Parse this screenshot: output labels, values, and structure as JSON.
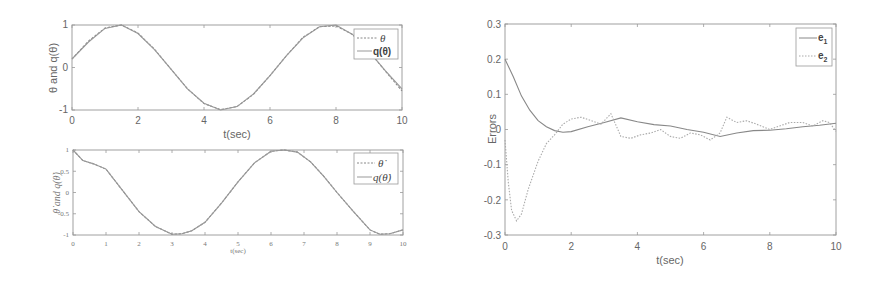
{
  "chart_data": [
    {
      "id": "top-left",
      "type": "line",
      "title": "",
      "xlabel": "t(sec)",
      "ylabel": "θ and q(θ)",
      "xlim": [
        0,
        10
      ],
      "ylim": [
        -1,
        1
      ],
      "xticks": [
        0,
        2,
        4,
        6,
        8,
        10
      ],
      "xtick_labels": [
        "0",
        "2",
        "4",
        "6",
        "8",
        "10"
      ],
      "yticks": [
        1,
        0,
        -1
      ],
      "ytick_labels": [
        "1",
        "0",
        "-1"
      ],
      "grid": false,
      "legend_position": "upper right",
      "series": [
        {
          "name": "θ",
          "style": "dashed",
          "color": "#888888",
          "x": [
            0,
            0.5,
            1,
            1.5,
            2,
            2.5,
            3,
            3.5,
            4,
            4.5,
            5,
            5.5,
            6,
            6.5,
            7,
            7.5,
            8,
            8.5,
            9,
            9.5,
            10
          ],
          "values": [
            0.2,
            0.62,
            0.93,
            1.0,
            0.81,
            0.43,
            -0.04,
            -0.5,
            -0.85,
            -0.99,
            -0.92,
            -0.63,
            -0.19,
            0.28,
            0.71,
            0.96,
            0.98,
            0.78,
            0.38,
            -0.09,
            -0.55
          ]
        },
        {
          "name": "q(θ)",
          "style": "solid",
          "color": "#999999",
          "x": [
            0,
            0.5,
            1,
            1.5,
            2,
            2.5,
            3,
            3.5,
            4,
            4.5,
            5,
            5.5,
            6,
            6.5,
            7,
            7.5,
            8,
            8.5,
            9,
            9.5,
            10
          ],
          "values": [
            0.2,
            0.6,
            0.92,
            1.0,
            0.8,
            0.42,
            -0.04,
            -0.5,
            -0.84,
            -1.0,
            -0.92,
            -0.62,
            -0.19,
            0.28,
            0.7,
            0.96,
            1.0,
            0.78,
            0.38,
            -0.08,
            -0.5
          ]
        }
      ]
    },
    {
      "id": "bottom-left",
      "type": "line",
      "title": "",
      "xlabel": "t(sec)",
      "ylabel": "θ̇ and q(θ̇)",
      "xlim": [
        0,
        10
      ],
      "ylim": [
        -1,
        1
      ],
      "xticks": [
        0,
        1,
        2,
        3,
        4,
        5,
        6,
        7,
        8,
        9,
        10
      ],
      "xtick_labels": [
        "0",
        "1",
        "2",
        "3",
        "4",
        "5",
        "6",
        "7",
        "8",
        "9",
        "10"
      ],
      "yticks": [
        1,
        0.5,
        0,
        -0.5,
        -1
      ],
      "ytick_labels": [
        "1",
        "0.5",
        "0",
        "-0.5",
        "-1"
      ],
      "grid": false,
      "legend_position": "upper right",
      "series": [
        {
          "name": "θ̇",
          "style": "dashed",
          "color": "#888888",
          "x": [
            0,
            0.3,
            0.6,
            1,
            1.5,
            2,
            2.5,
            3,
            3.3,
            3.6,
            4,
            4.5,
            5,
            5.5,
            6,
            6.4,
            6.8,
            7.2,
            7.6,
            8,
            8.5,
            9,
            9.3,
            9.6,
            10
          ],
          "values": [
            1.0,
            0.75,
            0.68,
            0.55,
            0.05,
            -0.45,
            -0.8,
            -0.98,
            -0.97,
            -0.9,
            -0.7,
            -0.25,
            0.25,
            0.7,
            0.97,
            1.0,
            0.95,
            0.72,
            0.38,
            0.0,
            -0.45,
            -0.88,
            -0.98,
            -0.97,
            -0.88
          ]
        },
        {
          "name": "q(θ̇)",
          "style": "solid",
          "color": "#999999",
          "x": [
            0,
            0.3,
            0.6,
            1,
            1.5,
            2,
            2.5,
            3,
            3.3,
            3.6,
            4,
            4.5,
            5,
            5.5,
            6,
            6.4,
            6.8,
            7.2,
            7.6,
            8,
            8.5,
            9,
            9.3,
            9.6,
            10
          ],
          "values": [
            1.0,
            0.75,
            0.68,
            0.55,
            0.05,
            -0.45,
            -0.8,
            -0.98,
            -0.97,
            -0.9,
            -0.7,
            -0.25,
            0.25,
            0.7,
            0.97,
            1.0,
            0.95,
            0.72,
            0.38,
            0.0,
            -0.45,
            -0.88,
            -0.98,
            -0.97,
            -0.88
          ]
        }
      ]
    },
    {
      "id": "right",
      "type": "line",
      "title": "",
      "xlabel": "t(sec)",
      "ylabel": "Errors",
      "xlim": [
        0,
        10
      ],
      "ylim": [
        -0.3,
        0.3
      ],
      "xticks": [
        0,
        2,
        4,
        6,
        8,
        10
      ],
      "xtick_labels": [
        "0",
        "2",
        "4",
        "6",
        "8",
        "10"
      ],
      "yticks": [
        0.3,
        0.2,
        0.1,
        0,
        -0.1,
        -0.2,
        -0.3
      ],
      "ytick_labels": [
        "0.3",
        "0.2",
        "0.1",
        "0",
        "-0.1",
        "-0.2",
        "-0.3"
      ],
      "grid": false,
      "legend_position": "upper right",
      "series": [
        {
          "name": "e1",
          "style": "solid",
          "color": "#888888",
          "x": [
            0,
            0.25,
            0.5,
            0.75,
            1,
            1.25,
            1.5,
            1.75,
            2,
            2.5,
            3,
            3.5,
            4,
            4.5,
            5,
            5.5,
            6,
            6.5,
            7,
            7.5,
            8,
            8.5,
            9,
            9.5,
            10
          ],
          "values": [
            0.2,
            0.15,
            0.095,
            0.055,
            0.025,
            0.008,
            -0.003,
            -0.008,
            -0.006,
            0.008,
            0.02,
            0.033,
            0.022,
            0.014,
            0.01,
            0.0,
            -0.008,
            -0.02,
            -0.01,
            -0.003,
            -0.002,
            0.002,
            0.008,
            0.012,
            0.018
          ]
        },
        {
          "name": "e2",
          "style": "dotted",
          "color": "#aaaaaa",
          "x": [
            0,
            0.1,
            0.2,
            0.35,
            0.5,
            0.7,
            1,
            1.25,
            1.5,
            1.75,
            2,
            2.3,
            2.6,
            2.9,
            3.2,
            3.5,
            3.8,
            4.1,
            4.4,
            4.7,
            5,
            5.3,
            5.6,
            5.9,
            6.2,
            6.5,
            6.7,
            7,
            7.3,
            7.6,
            8,
            8.3,
            8.6,
            9,
            9.3,
            9.6,
            9.8,
            10
          ],
          "values": [
            -0.03,
            -0.15,
            -0.23,
            -0.26,
            -0.24,
            -0.17,
            -0.09,
            -0.04,
            -0.015,
            0.015,
            0.03,
            0.035,
            0.025,
            0.015,
            0.045,
            -0.02,
            -0.025,
            -0.015,
            -0.01,
            0.0,
            -0.02,
            -0.025,
            -0.01,
            -0.015,
            -0.03,
            -0.01,
            0.035,
            0.02,
            0.025,
            0.015,
            0.0,
            0.01,
            0.02,
            0.02,
            0.01,
            0.025,
            0.02,
            -0.005
          ]
        }
      ]
    }
  ],
  "legends": {
    "top_left": {
      "items": [
        {
          "label": "θ",
          "style": "dashed"
        },
        {
          "label": "q(θ)",
          "style": "solid"
        }
      ]
    },
    "bottom_left": {
      "items": [
        {
          "label": "θ̇",
          "style": "dashed"
        },
        {
          "label": "q(θ̇)",
          "style": "solid"
        }
      ]
    },
    "right": {
      "items": [
        {
          "label": "e",
          "sub": "1",
          "style": "solid"
        },
        {
          "label": "e",
          "sub": "2",
          "style": "dotted"
        }
      ]
    }
  },
  "colors": {
    "axis": "#999999",
    "line_main": "#8a8a8a",
    "line_dashed": "#8a8a8a",
    "line_dotted": "#b0b0b0",
    "background": "#ffffff"
  }
}
